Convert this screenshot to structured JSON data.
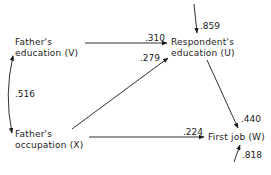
{
  "diagram": {
    "type": "path-diagram",
    "nodes": [
      {
        "id": "V",
        "line1": "Father's",
        "line2": "education (V)"
      },
      {
        "id": "X",
        "line1": "Father's",
        "line2": "occupation (X)"
      },
      {
        "id": "U",
        "line1": "Respondent's",
        "line2": "education (U)"
      },
      {
        "id": "W",
        "line1": "First job (W)"
      }
    ],
    "edges": [
      {
        "from": "V",
        "to": "U",
        "coefficient": ".310"
      },
      {
        "from": "X",
        "to": "U",
        "coefficient": ".279"
      },
      {
        "from": "X",
        "to": "W",
        "coefficient": ".224"
      },
      {
        "from": "U",
        "to": "W",
        "coefficient": ".440"
      },
      {
        "from": "residual-U",
        "to": "U",
        "coefficient": ".859"
      },
      {
        "from": "residual-W",
        "to": "W",
        "coefficient": ".818"
      },
      {
        "from": "V",
        "to": "X",
        "coefficient": ".516",
        "kind": "correlation-curved-double-arrow"
      }
    ],
    "stroke_color": "#1a1a1a"
  }
}
